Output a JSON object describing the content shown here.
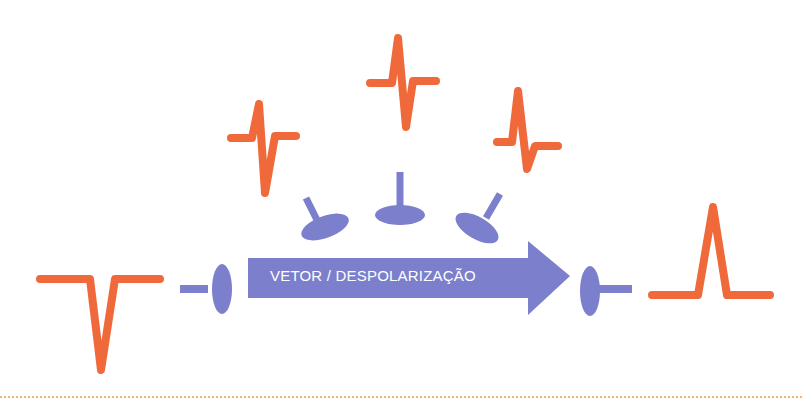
{
  "diagram": {
    "arrow": {
      "label": "VETOR / DESPOLARIZAÇÃO",
      "color": "#7b7fcc"
    },
    "colors": {
      "waveform": "#f0693a",
      "electrode": "#7b7fcc",
      "divider": "#f2b27a",
      "background": "#ffffff"
    },
    "waveforms": [
      {
        "id": "left-negative-deflection",
        "shape": "negative"
      },
      {
        "id": "upper-left-biphasic",
        "shape": "biphasic"
      },
      {
        "id": "top-center-biphasic",
        "shape": "biphasic"
      },
      {
        "id": "upper-right-biphasic",
        "shape": "biphasic"
      },
      {
        "id": "right-positive-deflection",
        "shape": "positive"
      }
    ],
    "electrodes": [
      {
        "id": "left-electrode",
        "orientation": "facing-right"
      },
      {
        "id": "upper-left-electrode",
        "orientation": "angled"
      },
      {
        "id": "top-center-electrode",
        "orientation": "facing-down"
      },
      {
        "id": "upper-right-electrode",
        "orientation": "angled"
      },
      {
        "id": "right-electrode",
        "orientation": "facing-left"
      }
    ]
  }
}
